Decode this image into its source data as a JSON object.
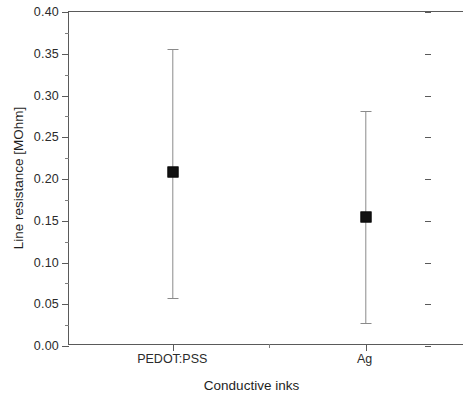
{
  "chart_data": {
    "type": "scatter",
    "title": "",
    "xlabel": "Conductive inks",
    "ylabel": "Line resistance [MOhm]",
    "categories": [
      "PEDOT:PSS",
      "Ag"
    ],
    "values": [
      0.208,
      0.155
    ],
    "error_upper": [
      0.356,
      0.282
    ],
    "error_lower": [
      0.058,
      0.028
    ],
    "series": [
      {
        "name": "Line resistance",
        "points": [
          {
            "category": "PEDOT:PSS",
            "value": 0.208,
            "err_high": 0.356,
            "err_low": 0.058
          },
          {
            "category": "Ag",
            "value": 0.155,
            "err_high": 0.282,
            "err_low": 0.028
          }
        ]
      }
    ],
    "ylim": [
      0.0,
      0.4
    ],
    "ytick_labels": [
      "0.00",
      "0.05",
      "0.10",
      "0.15",
      "0.20",
      "0.25",
      "0.30",
      "0.35",
      "0.40"
    ],
    "ytick_values": [
      0.0,
      0.05,
      0.1,
      0.15,
      0.2,
      0.25,
      0.3,
      0.35,
      0.4
    ],
    "yminor_step": 0.025,
    "grid": false,
    "legend": null,
    "marker_style": "filled-square",
    "marker_color": "#111111",
    "errorbar_color": "#8a8a8a",
    "axis_color": "#5a5a5a"
  },
  "axis": {
    "y_title": "Line resistance [MOhm]",
    "x_title": "Conductive inks",
    "y_ticks": [
      {
        "label": "0.40",
        "value": 0.4
      },
      {
        "label": "0.35",
        "value": 0.35
      },
      {
        "label": "0.30",
        "value": 0.3
      },
      {
        "label": "0.25",
        "value": 0.25
      },
      {
        "label": "0.20",
        "value": 0.2
      },
      {
        "label": "0.15",
        "value": 0.15
      },
      {
        "label": "0.10",
        "value": 0.1
      },
      {
        "label": "0.05",
        "value": 0.05
      },
      {
        "label": "0.00",
        "value": 0.0
      }
    ],
    "x_ticks": [
      {
        "label": "PEDOT:PSS",
        "position": 0.264
      },
      {
        "label": "",
        "position": 0.506
      },
      {
        "label": "Ag",
        "position": 0.751
      }
    ]
  }
}
